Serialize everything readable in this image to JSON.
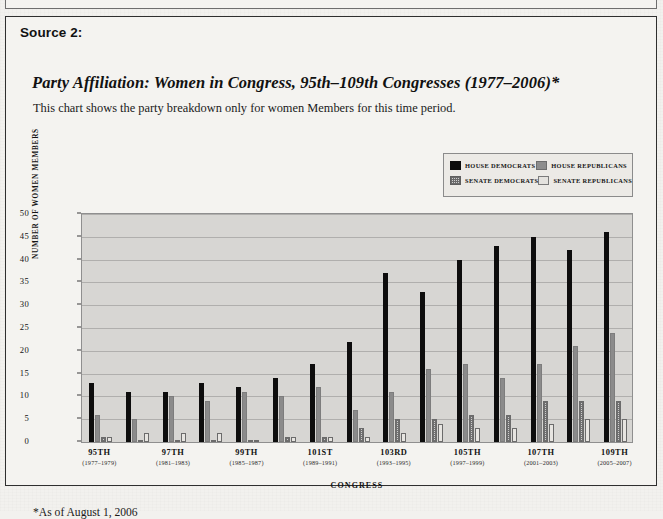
{
  "source_label": "Source 2:",
  "chart_title": "Party Affiliation: Women in Congress, 95th–109th Congresses (1977–2006)*",
  "chart_subtitle": "This chart shows the party breakdown only for women Members for this time period.",
  "footnote": "*As of August 1, 2006",
  "legend": [
    {
      "label": "HOUSE DEMOCRATS",
      "key": "hd",
      "color": "#0d0d0d"
    },
    {
      "label": "HOUSE REPUBLICANS",
      "key": "hr",
      "color": "#8b8b8b"
    },
    {
      "label": "SENATE DEMOCRATS",
      "key": "sd",
      "color": "#cdcdcd"
    },
    {
      "label": "SENATE REPUBLICANS",
      "key": "sr",
      "color": "#e7e5e1"
    }
  ],
  "chart_data": {
    "type": "bar",
    "title": "Party Affiliation: Women in Congress, 95th–109th Congresses (1977–2006)*",
    "xlabel": "CONGRESS",
    "ylabel": "NUMBER OF WOMEN MEMBERS",
    "ylim": [
      0,
      50
    ],
    "yticks": [
      0,
      5,
      10,
      15,
      20,
      25,
      30,
      35,
      40,
      45,
      50
    ],
    "grid": true,
    "legend_position": "top-right",
    "categories": [
      "95th",
      "96th",
      "97th",
      "98th",
      "99th",
      "100th",
      "101st",
      "102nd",
      "103rd",
      "104th",
      "105th",
      "106th",
      "107th",
      "108th",
      "109th"
    ],
    "tick_labels": [
      {
        "index": 0,
        "main": "95TH",
        "years": "(1977–1979)"
      },
      {
        "index": 2,
        "main": "97TH",
        "years": "(1981–1983)"
      },
      {
        "index": 4,
        "main": "99TH",
        "years": "(1985–1987)"
      },
      {
        "index": 6,
        "main": "101ST",
        "years": "(1989–1991)"
      },
      {
        "index": 8,
        "main": "103RD",
        "years": "(1993–1995)"
      },
      {
        "index": 10,
        "main": "105TH",
        "years": "(1997–1999)"
      },
      {
        "index": 12,
        "main": "107TH",
        "years": "(2001–2003)"
      },
      {
        "index": 14,
        "main": "109TH",
        "years": "(2005–2007)"
      }
    ],
    "series": [
      {
        "name": "HOUSE DEMOCRATS",
        "key": "hd",
        "values": [
          13,
          11,
          11,
          13,
          12,
          14,
          17,
          22,
          37,
          33,
          40,
          43,
          45,
          42,
          46
        ]
      },
      {
        "name": "HOUSE REPUBLICANS",
        "key": "hr",
        "values": [
          6,
          5,
          10,
          9,
          11,
          10,
          12,
          7,
          11,
          16,
          17,
          14,
          17,
          21,
          24
        ]
      },
      {
        "name": "SENATE DEMOCRATS",
        "key": "sd",
        "values": [
          1,
          0,
          0,
          0,
          0,
          1,
          1,
          3,
          5,
          5,
          6,
          6,
          9,
          9,
          9
        ]
      },
      {
        "name": "SENATE REPUBLICANS",
        "key": "sr",
        "values": [
          1,
          2,
          2,
          2,
          0,
          1,
          1,
          1,
          2,
          4,
          3,
          3,
          4,
          5,
          5
        ]
      }
    ]
  }
}
